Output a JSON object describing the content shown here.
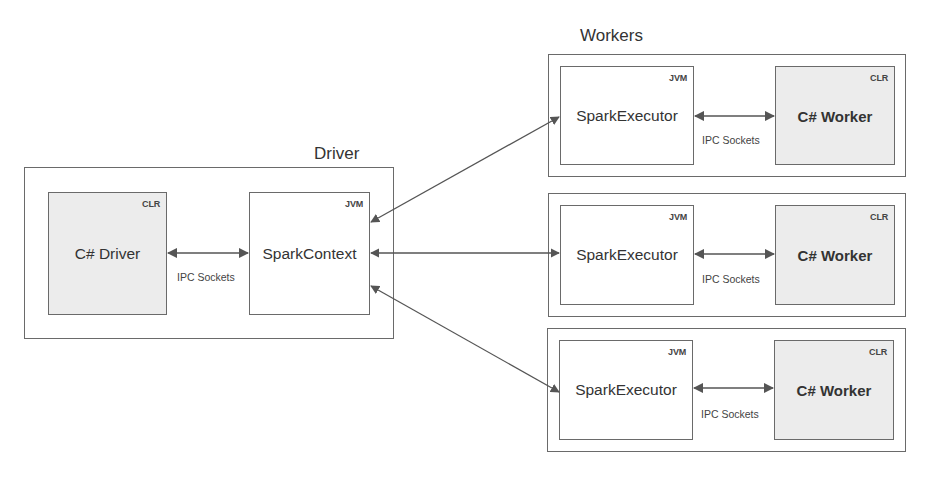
{
  "driver": {
    "title": "Driver",
    "csharp_driver": {
      "label": "C# Driver",
      "runtime": "CLR"
    },
    "spark_context": {
      "label": "SparkContext",
      "runtime": "JVM"
    },
    "ipc_label": "IPC Sockets"
  },
  "workers": {
    "title": "Workers",
    "items": [
      {
        "executor": {
          "label": "SparkExecutor",
          "runtime": "JVM"
        },
        "worker": {
          "label": "C# Worker",
          "runtime": "CLR"
        },
        "ipc_label": "IPC Sockets"
      },
      {
        "executor": {
          "label": "SparkExecutor",
          "runtime": "JVM"
        },
        "worker": {
          "label": "C# Worker",
          "runtime": "CLR"
        },
        "ipc_label": "IPC Sockets"
      },
      {
        "executor": {
          "label": "SparkExecutor",
          "runtime": "JVM"
        },
        "worker": {
          "label": "C# Worker",
          "runtime": "CLR"
        },
        "ipc_label": "IPC Sockets"
      }
    ]
  },
  "colors": {
    "border": "#6a6a6a",
    "clr_fill": "#ececec",
    "jvm_fill": "#ffffff",
    "arrow": "#555555",
    "text": "#333333"
  }
}
